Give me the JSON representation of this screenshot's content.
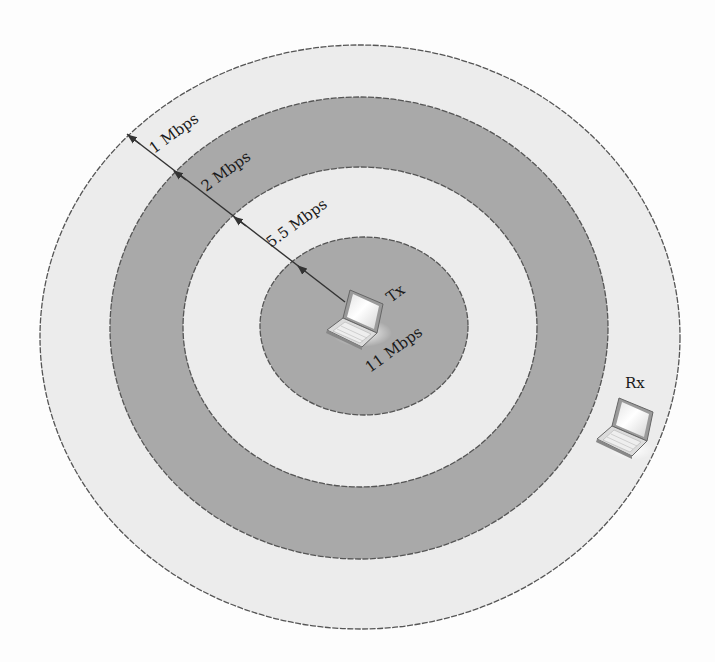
{
  "diagram": {
    "colors": {
      "background": "#fdfdfd",
      "light_zone": "#ececec",
      "dark_zone": "#a9a9a9",
      "edge": "#555555",
      "text": "#1a1a1a"
    },
    "zones": [
      {
        "id": "zone-11",
        "label": "11 Mbps",
        "shade": "dark",
        "cx": 364,
        "cy": 326,
        "rx": 104,
        "ry": 89
      },
      {
        "id": "zone-5-5",
        "label": "5.5 Mbps",
        "shade": "light",
        "cx": 360,
        "cy": 327,
        "rx": 177,
        "ry": 160
      },
      {
        "id": "zone-2",
        "label": "2 Mbps",
        "shade": "dark",
        "cx": 359,
        "cy": 328,
        "rx": 249,
        "ry": 231
      },
      {
        "id": "zone-1",
        "label": "1 Mbps",
        "shade": "light",
        "cx": 360,
        "cy": 337,
        "rx": 320,
        "ry": 292
      }
    ],
    "labels": {
      "rate_1": "1 Mbps",
      "rate_2": "2 Mbps",
      "rate_5_5": "5.5 Mbps",
      "rate_11": "11 Mbps",
      "tx": "Tx",
      "rx": "Rx"
    },
    "nodes": {
      "tx": {
        "name": "Tx",
        "icon": "laptop-icon",
        "x": 352,
        "y": 318
      },
      "rx": {
        "name": "Rx",
        "icon": "laptop-icon",
        "x": 626,
        "y": 428
      }
    }
  }
}
